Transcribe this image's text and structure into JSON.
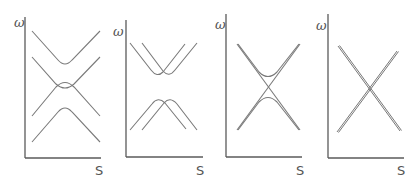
{
  "figure": {
    "colors": {
      "axis": "#5a5a5a",
      "curve": "#7a7a7a",
      "label": "#555555",
      "background": "#ffffff"
    },
    "panels": [
      {
        "id": "panel-1",
        "y_label": "ω",
        "x_label": "S",
        "content": "two avoided-crossing hyperbola pairs, upper and lower, with a central crossing region"
      },
      {
        "id": "panel-2",
        "y_label": "ω",
        "x_label": "S",
        "content": "two shifted V-shaped branches above and two shifted inverted-V branches below"
      },
      {
        "id": "panel-3",
        "y_label": "ω",
        "x_label": "S",
        "content": "crossing straight lines with a hyperbolic avoided crossing pair"
      },
      {
        "id": "panel-4",
        "y_label": "ω",
        "x_label": "S",
        "content": "two doubled straight lines crossing in an X"
      }
    ]
  }
}
